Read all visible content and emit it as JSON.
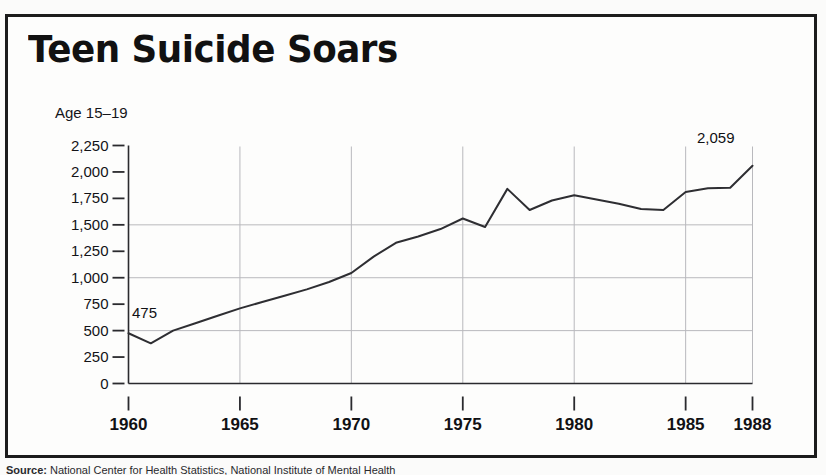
{
  "figure": {
    "title": "Teen Suicide Soars",
    "series_caption": "Age 15–19",
    "source_lead": "Source:",
    "source_text": "National Center for Health Statistics, National Institute of Mental Health"
  },
  "colors": {
    "frame": "#1c1c1c",
    "paper": "#fdfdfc",
    "line": "#2e2e32",
    "gridline": "#b9b9bd",
    "axis": "#2a2a2e",
    "text": "#111114"
  },
  "chart_data": {
    "type": "line",
    "title": "Teen Suicide Soars",
    "subtitle": "Age 15–19",
    "xlabel": "",
    "ylabel": "",
    "xlim": [
      1960,
      1988
    ],
    "ylim": [
      0,
      2250
    ],
    "grid": true,
    "legend": "none",
    "y_ticks": [
      "2,250",
      "2,000",
      "1,750",
      "1,500",
      "1,250",
      "1,000",
      "750",
      "500",
      "250",
      "0"
    ],
    "y_tick_values": [
      2250,
      2000,
      1750,
      1500,
      1250,
      1000,
      750,
      500,
      250,
      0
    ],
    "x_ticks": [
      "1960",
      "1965",
      "1970",
      "1975",
      "1980",
      "1985",
      "1988"
    ],
    "x_tick_values": [
      1960,
      1965,
      1970,
      1975,
      1980,
      1985,
      1988
    ],
    "gridlines_horizontal": [
      500,
      1000,
      1500
    ],
    "gridlines_vertical": [
      1960,
      1965,
      1970,
      1975,
      1980,
      1985,
      1988
    ],
    "annotations": [
      {
        "text": "475",
        "x": 1960,
        "y": 475
      },
      {
        "text": "2,059",
        "x": 1988,
        "y": 2059
      }
    ],
    "series": [
      {
        "name": "Suicides, age 15–19",
        "x": [
          1960,
          1961,
          1962,
          1963,
          1964,
          1965,
          1966,
          1967,
          1968,
          1969,
          1970,
          1971,
          1972,
          1973,
          1974,
          1975,
          1976,
          1977,
          1978,
          1979,
          1980,
          1981,
          1982,
          1983,
          1984,
          1985,
          1986,
          1987,
          1988
        ],
        "values": [
          475,
          380,
          500,
          570,
          640,
          710,
          770,
          830,
          890,
          960,
          1045,
          1200,
          1330,
          1390,
          1460,
          1560,
          1480,
          1840,
          1640,
          1730,
          1780,
          1740,
          1700,
          1650,
          1640,
          1810,
          1845,
          1850,
          2059
        ]
      }
    ]
  }
}
